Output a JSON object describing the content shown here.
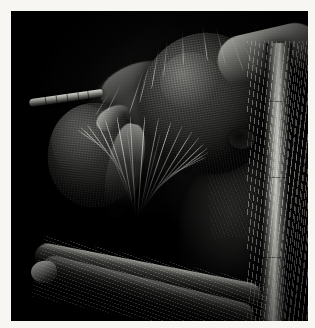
{
  "image": {
    "kind": "scanning-electron-micrograph",
    "subject": "insect head",
    "caption": "",
    "background_color": "#000000",
    "frame_color": "#f7f6f3",
    "frame_inset_px": 11,
    "width_px": 315,
    "height_px": 328
  },
  "specimen": {
    "common_name": "insect head (dipteran)",
    "orientation": "lateral-oblique, head facing left",
    "illumination": "secondary-electron, grayscale"
  },
  "anatomy": {
    "eye_large": {
      "label": "large compound eye",
      "surface": "hexagonal ommatidia facets",
      "tone": "#4d4d4a"
    },
    "eye_small": {
      "label": "second compound eye",
      "surface": "hexagonal ommatidia facets",
      "tone": "#3c3c3a"
    },
    "antenna": {
      "label": "antenna / maxillary palp",
      "segments": 6
    },
    "proboscis": {
      "label": "proboscis with radiating setae"
    },
    "palp": {
      "label": "maxillary palp"
    },
    "vertex": {
      "label": "vertex ridge"
    },
    "leg_right": {
      "label": "foreleg tibia with dense bristles"
    },
    "leg_right_femur": {
      "label": "foreleg femur, segmented"
    },
    "leg_lower": {
      "label": "lower leg segment crossing frame"
    },
    "thorax": {
      "label": "thorax in shadow"
    },
    "occiput": {
      "label": "occipital setae"
    },
    "neck_socket": {
      "label": "neck socket / cervical membrane"
    }
  },
  "palette": {
    "black": "#000000",
    "deep_gray": "#131312",
    "mid_gray": "#6f6f6c",
    "highlight": "#e2e2de",
    "frame": "#f7f6f3"
  }
}
